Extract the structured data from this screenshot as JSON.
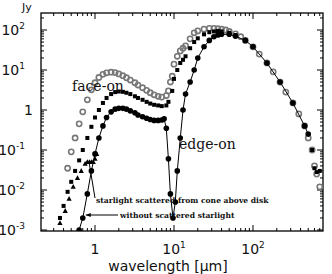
{
  "chart_data": {
    "type": "scatter",
    "title": "",
    "xlabel": "wavelength [μm]",
    "ylabel": "Jy",
    "xscale": "log",
    "yscale": "log",
    "xlim": [
      0.3,
      900
    ],
    "ylim": [
      0.001,
      200
    ],
    "x_ticks": [
      {
        "value": 1,
        "label": "1"
      },
      {
        "value": 10,
        "label": "10",
        "sup": "1"
      },
      {
        "value": 100,
        "label": "10",
        "sup": "2"
      }
    ],
    "y_ticks": [
      {
        "value": 100,
        "label": "10",
        "sup": "2"
      },
      {
        "value": 10,
        "label": "10",
        "sup": "1"
      },
      {
        "value": 1,
        "label": "1",
        "sup": ""
      },
      {
        "value": 0.1,
        "label": "10",
        "sup": "-1"
      },
      {
        "value": 0.01,
        "label": "10",
        "sup": "-2"
      },
      {
        "value": 0.001,
        "label": "10",
        "sup": "-3"
      }
    ],
    "grid": false,
    "series": [
      {
        "name": "face-on",
        "marker": "open-circle",
        "color": "#777777",
        "points": [
          [
            0.45,
            0.035
          ],
          [
            0.5,
            0.09
          ],
          [
            0.56,
            0.2
          ],
          [
            0.63,
            0.45
          ],
          [
            0.7,
            0.9
          ],
          [
            0.8,
            1.8
          ],
          [
            0.9,
            3.2
          ],
          [
            1.0,
            4.8
          ],
          [
            1.12,
            6.5
          ],
          [
            1.26,
            7.8
          ],
          [
            1.4,
            8.5
          ],
          [
            1.6,
            8.8
          ],
          [
            1.8,
            8.6
          ],
          [
            2.0,
            8.0
          ],
          [
            2.25,
            7.2
          ],
          [
            2.5,
            6.4
          ],
          [
            2.8,
            5.6
          ],
          [
            3.2,
            4.8
          ],
          [
            3.5,
            4.2
          ],
          [
            4.0,
            3.6
          ],
          [
            4.5,
            3.1
          ],
          [
            5.0,
            2.7
          ],
          [
            5.6,
            2.4
          ],
          [
            6.3,
            2.2
          ],
          [
            7.0,
            2.1
          ],
          [
            8.0,
            2.3
          ],
          [
            8.5,
            3.0
          ],
          [
            9.0,
            5
          ],
          [
            9.5,
            7
          ],
          [
            10,
            14
          ],
          [
            11,
            22
          ],
          [
            12,
            30
          ],
          [
            13,
            35
          ],
          [
            14,
            40
          ],
          [
            16,
            60
          ],
          [
            18,
            85
          ],
          [
            20,
            95
          ],
          [
            24,
            105
          ],
          [
            28,
            110
          ],
          [
            32,
            110
          ],
          [
            36,
            108
          ],
          [
            40,
            105
          ],
          [
            45,
            100
          ],
          [
            50,
            92
          ],
          [
            60,
            80
          ],
          [
            70,
            68
          ],
          [
            80,
            55
          ],
          [
            100,
            38
          ],
          [
            120,
            25
          ],
          [
            150,
            15
          ],
          [
            180,
            9
          ],
          [
            220,
            5
          ],
          [
            260,
            2.8
          ],
          [
            320,
            1.5
          ],
          [
            380,
            0.8
          ],
          [
            450,
            0.4
          ],
          [
            500,
            0.2
          ],
          [
            560,
            0.1
          ],
          [
            600,
            0.04
          ],
          [
            640,
            0.025
          ],
          [
            700,
            0.012
          ]
        ]
      },
      {
        "name": "intermediate inclination",
        "marker": "filled-square",
        "color": "#000000",
        "points": [
          [
            0.36,
            0.002
          ],
          [
            0.4,
            0.004
          ],
          [
            0.45,
            0.009
          ],
          [
            0.5,
            0.016
          ],
          [
            0.56,
            0.03
          ],
          [
            0.63,
            0.055
          ],
          [
            0.7,
            0.1
          ],
          [
            0.8,
            0.2
          ],
          [
            0.9,
            0.38
          ],
          [
            1.0,
            0.65
          ],
          [
            1.12,
            1.0
          ],
          [
            1.26,
            1.5
          ],
          [
            1.4,
            2.0
          ],
          [
            1.6,
            2.5
          ],
          [
            1.8,
            2.8
          ],
          [
            2.0,
            2.9
          ],
          [
            2.25,
            2.85
          ],
          [
            2.5,
            2.7
          ],
          [
            2.8,
            2.5
          ],
          [
            3.2,
            2.2
          ],
          [
            3.5,
            2.0
          ],
          [
            4.0,
            1.8
          ],
          [
            4.5,
            1.6
          ],
          [
            5.0,
            1.45
          ],
          [
            5.6,
            1.35
          ],
          [
            6.3,
            1.3
          ],
          [
            7.0,
            1.25
          ],
          [
            8.0,
            1.3
          ],
          [
            8.5,
            1.6
          ],
          [
            9.5,
            3
          ],
          [
            10,
            6
          ],
          [
            11,
            10
          ],
          [
            12,
            15
          ],
          [
            13,
            18
          ],
          [
            14,
            22
          ],
          [
            16,
            35
          ],
          [
            18,
            50
          ],
          [
            20,
            62
          ],
          [
            24,
            78
          ],
          [
            28,
            88
          ],
          [
            32,
            92
          ],
          [
            36,
            94
          ],
          [
            40,
            92
          ],
          [
            50,
            85
          ],
          [
            60,
            75
          ],
          [
            80,
            55
          ],
          [
            100,
            38
          ],
          [
            150,
            15
          ],
          [
            220,
            5
          ],
          [
            320,
            1.5
          ],
          [
            450,
            0.4
          ],
          [
            560,
            0.1
          ],
          [
            600,
            0.035
          ],
          [
            640,
            0.028
          ],
          [
            700,
            0.03
          ]
        ]
      },
      {
        "name": "edge-on",
        "marker": "filled-circle-line",
        "color": "#000000",
        "points": [
          [
            0.63,
            0.001
          ],
          [
            0.7,
            0.002
          ],
          [
            0.8,
            0.008
          ],
          [
            0.9,
            0.03
          ],
          [
            1.0,
            0.08
          ],
          [
            1.12,
            0.2
          ],
          [
            1.26,
            0.4
          ],
          [
            1.4,
            0.65
          ],
          [
            1.6,
            0.9
          ],
          [
            1.8,
            1.05
          ],
          [
            2.0,
            1.1
          ],
          [
            2.25,
            1.1
          ],
          [
            2.5,
            1.05
          ],
          [
            2.8,
            0.95
          ],
          [
            3.2,
            0.85
          ],
          [
            3.5,
            0.75
          ],
          [
            4.0,
            0.68
          ],
          [
            4.5,
            0.62
          ],
          [
            5.0,
            0.58
          ],
          [
            5.6,
            0.55
          ],
          [
            6.3,
            0.55
          ],
          [
            7.0,
            0.56
          ],
          [
            7.5,
            0.6
          ],
          [
            8.0,
            0.35
          ],
          [
            8.5,
            0.06
          ],
          [
            9.0,
            0.008
          ],
          [
            9.7,
            0.002
          ],
          [
            10.4,
            0.005
          ],
          [
            11,
            0.03
          ],
          [
            12,
            0.2
          ],
          [
            13,
            1.0
          ],
          [
            14,
            2.5
          ],
          [
            16,
            5
          ],
          [
            18,
            10
          ],
          [
            20,
            20
          ],
          [
            24,
            38
          ],
          [
            28,
            55
          ],
          [
            32,
            68
          ],
          [
            36,
            75
          ],
          [
            40,
            78
          ],
          [
            50,
            78
          ],
          [
            60,
            70
          ],
          [
            80,
            55
          ],
          [
            100,
            38
          ],
          [
            150,
            15
          ],
          [
            220,
            5
          ],
          [
            320,
            1.5
          ],
          [
            450,
            0.4
          ],
          [
            500,
            0.25
          ]
        ]
      },
      {
        "name": "starlight scattered from cone above disk",
        "marker": "filled-triangle",
        "color": "#000000",
        "points": [
          [
            0.36,
            0.0015
          ],
          [
            0.42,
            0.003
          ],
          [
            0.47,
            0.006
          ],
          [
            0.53,
            0.012
          ],
          [
            0.6,
            0.02
          ],
          [
            0.67,
            0.03
          ],
          [
            0.75,
            0.045
          ],
          [
            0.8,
            0.05
          ],
          [
            0.85,
            0.05
          ],
          [
            0.9,
            0.05
          ],
          [
            0.95,
            0.05
          ],
          [
            1.0,
            0.06
          ],
          [
            1.05,
            0.08
          ]
        ]
      }
    ],
    "annotations": [
      {
        "text": "face-on",
        "x": 0.68,
        "y": 18
      },
      {
        "text": "edge-on",
        "x": 10.5,
        "y": 0.15
      },
      {
        "text": "starlight scattered from cone above disk",
        "arrow_to": [
          0.8,
          0.05
        ]
      },
      {
        "text": "without scattered starlight",
        "arrow_to": [
          0.68,
          0.002
        ]
      }
    ],
    "legend": null
  }
}
